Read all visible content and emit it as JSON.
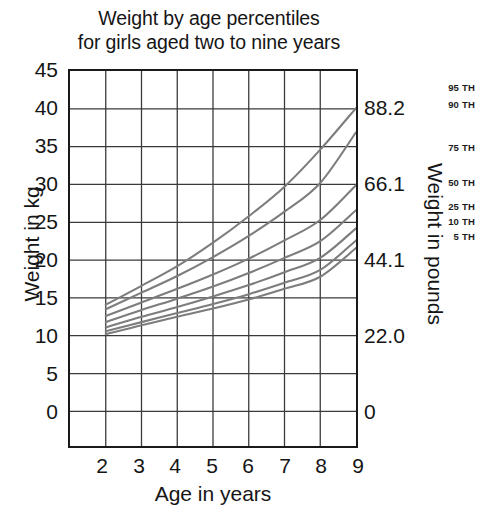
{
  "title": {
    "line1": "Weight by age percentiles",
    "line2": "for girls aged two to nine years"
  },
  "axes": {
    "xlabel": "Age in years",
    "ylabel_left": "Weight in kg",
    "ylabel_right": "Weight in pounds",
    "yticks_kg": [
      "45",
      "40",
      "35",
      "30",
      "25",
      "20",
      "15",
      "10",
      "5",
      "0"
    ],
    "xticks": [
      "2",
      "3",
      "4",
      "5",
      "6",
      "7",
      "8",
      "9"
    ],
    "yticks_pounds": [
      "88.2",
      "66.1",
      "44.1",
      "22.0",
      "0"
    ]
  },
  "percentile_labels": [
    {
      "text": "95 TH",
      "top": 82
    },
    {
      "text": "90 TH",
      "top": 99
    },
    {
      "text": "75 TH",
      "top": 142
    },
    {
      "text": "50 TH",
      "top": 177
    },
    {
      "text": "25 TH",
      "top": 201
    },
    {
      "text": "10 TH",
      "top": 216
    },
    {
      "text": "5 TH",
      "top": 231
    }
  ],
  "colors": {
    "curve": "#7d7d7d",
    "grid": "#3a3a3a",
    "frame": "#1a1a1a",
    "text": "#151515"
  },
  "chart_data": {
    "type": "line",
    "title": "Weight by age percentiles for girls aged two to nine years",
    "xlabel": "Age in years",
    "ylabel": "Weight in kg",
    "ylabel_secondary": "Weight in pounds",
    "xlim": [
      1,
      9
    ],
    "ylim": [
      0,
      45
    ],
    "ytick_step": 5,
    "grid": true,
    "legend": "right-side percentile annotations",
    "secondary_axis": {
      "ticks_kg": [
        40,
        30,
        20,
        10,
        0
      ],
      "ticks_pounds": [
        88.2,
        66.1,
        44.1,
        22.0,
        0
      ],
      "conversion": "1 kg = 2.2046 pounds"
    },
    "x": [
      2,
      3,
      4,
      5,
      6,
      7,
      8,
      9
    ],
    "series": [
      {
        "name": "95 TH",
        "values": [
          14.1,
          16.6,
          19.2,
          22.3,
          25.8,
          29.7,
          34.6,
          40.1
        ]
      },
      {
        "name": "90 TH",
        "values": [
          13.5,
          15.7,
          17.9,
          20.4,
          23.2,
          26.4,
          30.2,
          36.9
        ]
      },
      {
        "name": "75 TH",
        "values": [
          12.6,
          14.4,
          16.2,
          18.1,
          20.2,
          22.6,
          25.3,
          29.9
        ]
      },
      {
        "name": "50 TH",
        "values": [
          11.8,
          13.4,
          14.9,
          16.5,
          18.3,
          20.3,
          22.5,
          26.6
        ]
      },
      {
        "name": "25 TH",
        "values": [
          11.1,
          12.5,
          13.8,
          15.2,
          16.7,
          18.4,
          20.3,
          24.2
        ]
      },
      {
        "name": "10 TH",
        "values": [
          10.6,
          11.8,
          13.0,
          14.2,
          15.5,
          17.0,
          18.7,
          22.6
        ]
      },
      {
        "name": "5 TH",
        "values": [
          10.2,
          11.4,
          12.5,
          13.6,
          14.8,
          16.2,
          17.8,
          21.6
        ]
      }
    ]
  }
}
